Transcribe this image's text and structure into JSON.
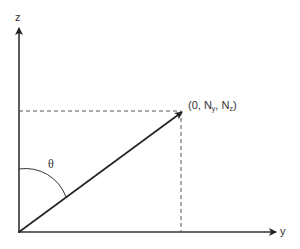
{
  "diagram": {
    "type": "coordinate-vector-diagram",
    "axes": {
      "vertical": {
        "label": "z"
      },
      "horizontal": {
        "label": "y"
      }
    },
    "vector": {
      "from": "origin",
      "to_label_prefix": "(0, N",
      "to_label_sub1": "y",
      "to_label_mid": ", N",
      "to_label_sub2": "z",
      "to_label_suffix": ")"
    },
    "angle": {
      "label": "θ",
      "between": [
        "z-axis",
        "vector"
      ]
    },
    "projections": {
      "style": "dashed",
      "lines": [
        "horizontal-to-z-axis",
        "vertical-to-y-axis"
      ]
    },
    "colors": {
      "line": "#333333",
      "dashed": "#555555",
      "background": "#ffffff"
    }
  }
}
